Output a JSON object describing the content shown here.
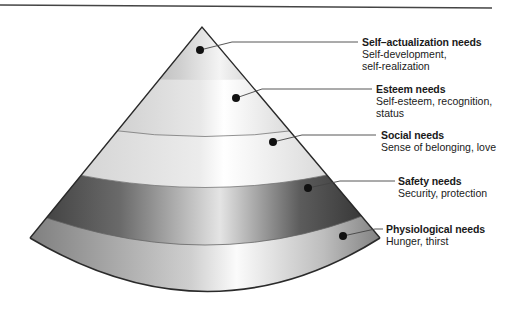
{
  "diagram": {
    "type": "hierarchy-cone",
    "levels": [
      {
        "title": "Self–actualization needs",
        "desc_lines": [
          "Self-development,",
          "self-realization"
        ]
      },
      {
        "title": "Esteem needs",
        "desc_lines": [
          "Self-esteem, recognition,",
          "status"
        ]
      },
      {
        "title": "Social needs",
        "desc_lines": [
          "Sense of belonging, love"
        ]
      },
      {
        "title": "Safety needs",
        "desc_lines": [
          "Security, protection"
        ]
      },
      {
        "title": "Physiological needs",
        "desc_lines": [
          "Hunger, thirst"
        ]
      }
    ],
    "colors": {
      "band_light": "#e6e6e6",
      "band_mid": "#b5b5b5",
      "band_dark": "#4a4a4a",
      "outline": "#2a2a2a",
      "text": "#1a1a1a"
    }
  }
}
